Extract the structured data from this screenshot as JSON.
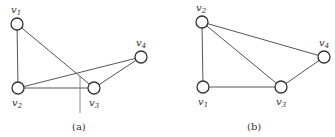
{
  "figure": {
    "graphs": [
      {
        "id": "a",
        "caption": "(a)",
        "nodes": [
          {
            "name": "v",
            "sub": "1",
            "x": 17,
            "y": 24,
            "label_pos": "above"
          },
          {
            "name": "v",
            "sub": "2",
            "x": 18,
            "y": 88,
            "label_pos": "below"
          },
          {
            "name": "v",
            "sub": "3",
            "x": 94,
            "y": 88,
            "label_pos": "below"
          },
          {
            "name": "v",
            "sub": "4",
            "x": 141,
            "y": 57,
            "label_pos": "above"
          }
        ],
        "edges": [
          [
            "v1",
            "v2"
          ],
          [
            "v1",
            "v3"
          ],
          [
            "v2",
            "v3"
          ],
          [
            "v2",
            "v4"
          ],
          [
            "v3",
            "v4"
          ]
        ]
      },
      {
        "id": "b",
        "caption": "(b)",
        "nodes": [
          {
            "name": "v",
            "sub": "2",
            "x": 202,
            "y": 22,
            "label_pos": "above"
          },
          {
            "name": "v",
            "sub": "1",
            "x": 203,
            "y": 87,
            "label_pos": "below"
          },
          {
            "name": "v",
            "sub": "3",
            "x": 281,
            "y": 87,
            "label_pos": "below"
          },
          {
            "name": "v",
            "sub": "4",
            "x": 324,
            "y": 57,
            "label_pos": "above"
          }
        ],
        "edges": [
          [
            "v2",
            "v1"
          ],
          [
            "v2",
            "v3"
          ],
          [
            "v2",
            "v4"
          ],
          [
            "v1",
            "v3"
          ],
          [
            "v3",
            "v4"
          ]
        ]
      }
    ]
  }
}
